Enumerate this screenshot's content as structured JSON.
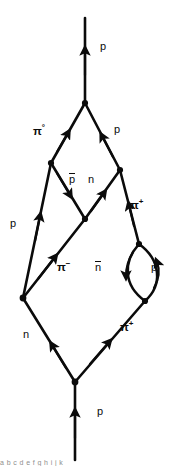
{
  "figure": {
    "type": "feynman-diagram",
    "background_color": "#ffffff",
    "ink_color": "#0b0b0b",
    "footer_text": "a b c d e f g h i j k"
  },
  "labels": [
    {
      "id": "p-top",
      "text": "p",
      "sup": "",
      "x": 100,
      "y": 41,
      "style": "roman"
    },
    {
      "id": "pi-zero",
      "text": "π",
      "sup": "°",
      "x": 33,
      "y": 122,
      "style": "greek"
    },
    {
      "id": "p-upper-right",
      "text": "p",
      "sup": "",
      "x": 114,
      "y": 124,
      "style": "roman"
    },
    {
      "id": "pbar",
      "text": "p",
      "sup": "",
      "x": 69,
      "y": 174,
      "style": "bar"
    },
    {
      "id": "n-mid",
      "text": "n",
      "sup": "",
      "x": 88,
      "y": 174,
      "style": "roman"
    },
    {
      "id": "pi-plus-upper",
      "text": "π",
      "sup": "+",
      "x": 130,
      "y": 196,
      "style": "greek"
    },
    {
      "id": "p-left",
      "text": "p",
      "sup": "",
      "x": 10,
      "y": 218,
      "style": "roman"
    },
    {
      "id": "pi-minus",
      "text": "π",
      "sup": "−",
      "x": 57,
      "y": 258,
      "style": "greek"
    },
    {
      "id": "nbar-loop",
      "text": "n",
      "sup": "",
      "x": 95,
      "y": 262,
      "style": "bar"
    },
    {
      "id": "p-loop",
      "text": "p",
      "sup": "",
      "x": 151,
      "y": 262,
      "style": "roman"
    },
    {
      "id": "n-lower-left",
      "text": "n",
      "sup": "",
      "x": 23,
      "y": 329,
      "style": "roman"
    },
    {
      "id": "pi-plus-lower",
      "text": "π",
      "sup": "+",
      "x": 120,
      "y": 318,
      "style": "greek"
    },
    {
      "id": "p-bottom",
      "text": "p",
      "sup": "",
      "x": 97,
      "y": 406,
      "style": "roman"
    }
  ],
  "vertices": [
    {
      "id": "v-top",
      "x": 85,
      "y": 103
    },
    {
      "id": "v-left-upper",
      "x": 51,
      "y": 163
    },
    {
      "id": "v-right-upper",
      "x": 120,
      "y": 170
    },
    {
      "id": "v-center",
      "x": 85,
      "y": 219
    },
    {
      "id": "v-loop-top",
      "x": 139,
      "y": 244
    },
    {
      "id": "v-loop-bottom",
      "x": 145,
      "y": 301
    },
    {
      "id": "v-left-lower",
      "x": 23,
      "y": 298
    },
    {
      "id": "v-bottom",
      "x": 75,
      "y": 382
    }
  ],
  "edges": [
    {
      "id": "p-incoming-top",
      "particle": "p",
      "from": "v-top",
      "to": "top-edge",
      "arrow": "up"
    },
    {
      "id": "pi0-edge",
      "particle": "π°",
      "from": "v-left-upper",
      "to": "v-top",
      "arrow": "up-right"
    },
    {
      "id": "p-upper-edge",
      "particle": "p",
      "from": "v-right-upper",
      "to": "v-top",
      "arrow": "up-left"
    },
    {
      "id": "pbar-edge",
      "particle": "p̄",
      "from": "v-left-upper",
      "to": "v-center",
      "arrow": "down-right"
    },
    {
      "id": "n-edge",
      "particle": "n",
      "from": "v-center",
      "to": "v-right-upper",
      "arrow": "up-right"
    },
    {
      "id": "pi-plus-up-edge",
      "particle": "π+",
      "from": "v-loop-top",
      "to": "v-right-upper",
      "arrow": "up-left"
    },
    {
      "id": "p-left-edge",
      "particle": "p",
      "from": "v-left-lower",
      "to": "v-left-upper",
      "arrow": "up-right"
    },
    {
      "id": "pi-minus-edge",
      "particle": "π−",
      "from": "v-left-lower",
      "to": "v-center",
      "arrow": "up-right"
    },
    {
      "id": "loop-left",
      "particle": "n̄",
      "from": "v-loop-top",
      "to": "v-loop-bottom",
      "arrow": "down"
    },
    {
      "id": "loop-right",
      "particle": "p",
      "from": "v-loop-bottom",
      "to": "v-loop-top",
      "arrow": "up"
    },
    {
      "id": "n-lower-edge",
      "particle": "n",
      "from": "v-bottom",
      "to": "v-left-lower",
      "arrow": "up-left"
    },
    {
      "id": "pi-plus-low-edge",
      "particle": "π+",
      "from": "v-bottom",
      "to": "v-loop-bottom",
      "arrow": "up-right"
    },
    {
      "id": "p-incoming-bot",
      "particle": "p",
      "from": "bottom-edge",
      "to": "v-bottom",
      "arrow": "up"
    }
  ]
}
